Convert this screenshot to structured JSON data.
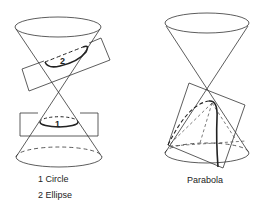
{
  "figure": {
    "left_panel": {
      "curve_markers": {
        "circle_marker": "1",
        "ellipse_marker": "2"
      },
      "legend": [
        {
          "label": "1 Circle"
        },
        {
          "label": "2 Ellipse"
        }
      ]
    },
    "right_panel": {
      "caption": "Parabola"
    },
    "colors": {
      "stroke": "#333333",
      "background": "#ffffff"
    }
  }
}
